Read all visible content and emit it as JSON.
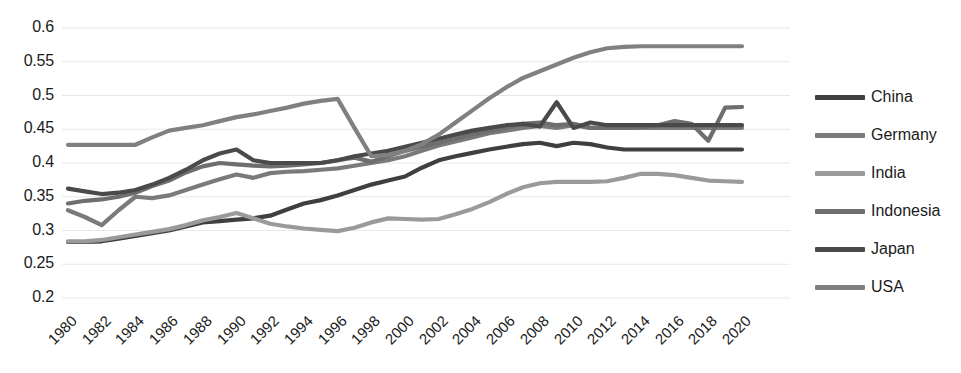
{
  "chart_data": {
    "type": "line",
    "title": "",
    "xlabel": "",
    "ylabel": "",
    "grid": true,
    "legend_position": "right",
    "ylim": [
      0.2,
      0.6
    ],
    "ytick_values": [
      0.6,
      0.55,
      0.5,
      0.45,
      0.4,
      0.35,
      0.3,
      0.25,
      0.2
    ],
    "ytick_labels": [
      "0.6",
      "0.55",
      "0.5",
      "0.45",
      "0.4",
      "0.35",
      "0.3",
      "0.25",
      "0.2"
    ],
    "x": [
      1980,
      1981,
      1982,
      1983,
      1984,
      1985,
      1986,
      1987,
      1988,
      1989,
      1990,
      1991,
      1992,
      1993,
      1994,
      1995,
      1996,
      1997,
      1998,
      1999,
      2000,
      2001,
      2002,
      2003,
      2004,
      2005,
      2006,
      2007,
      2008,
      2009,
      2010,
      2011,
      2012,
      2013,
      2014,
      2015,
      2016,
      2017,
      2018,
      2019,
      2020
    ],
    "xtick_labels": [
      "1980",
      "1982",
      "1984",
      "1986",
      "1988",
      "1990",
      "1992",
      "1994",
      "1996",
      "1998",
      "2000",
      "2002",
      "2004",
      "2006",
      "2008",
      "2010",
      "2012",
      "2014",
      "2016",
      "2018",
      "2020"
    ],
    "series": [
      {
        "name": "China",
        "color": "#3f3f3f",
        "values": [
          0.283,
          0.283,
          0.284,
          0.288,
          0.292,
          0.296,
          0.3,
          0.306,
          0.312,
          0.314,
          0.316,
          0.318,
          0.322,
          0.331,
          0.34,
          0.345,
          0.352,
          0.36,
          0.368,
          0.374,
          0.38,
          0.393,
          0.404,
          0.41,
          0.415,
          0.42,
          0.424,
          0.428,
          0.43,
          0.425,
          0.43,
          0.428,
          0.423,
          0.42,
          0.42,
          0.42,
          0.42,
          0.42,
          0.42,
          0.42,
          0.42
        ]
      },
      {
        "name": "Germany",
        "color": "#7a7a7a",
        "values": [
          0.33,
          0.32,
          0.308,
          0.33,
          0.35,
          0.348,
          0.352,
          0.36,
          0.368,
          0.376,
          0.383,
          0.378,
          0.385,
          0.387,
          0.388,
          0.39,
          0.392,
          0.396,
          0.4,
          0.404,
          0.41,
          0.418,
          0.426,
          0.432,
          0.438,
          0.444,
          0.448,
          0.452,
          0.455,
          0.452,
          0.456,
          0.452,
          0.452,
          0.452,
          0.452,
          0.452,
          0.452,
          0.452,
          0.452,
          0.452,
          0.452
        ]
      },
      {
        "name": "India",
        "color": "#9a9a9a",
        "values": [
          0.284,
          0.284,
          0.286,
          0.29,
          0.294,
          0.298,
          0.302,
          0.308,
          0.315,
          0.32,
          0.326,
          0.318,
          0.31,
          0.306,
          0.303,
          0.301,
          0.299,
          0.304,
          0.312,
          0.318,
          0.317,
          0.316,
          0.317,
          0.324,
          0.332,
          0.342,
          0.354,
          0.364,
          0.37,
          0.372,
          0.372,
          0.372,
          0.373,
          0.378,
          0.384,
          0.384,
          0.382,
          0.378,
          0.374,
          0.373,
          0.372
        ]
      },
      {
        "name": "Indonesia",
        "color": "#6e6e6e",
        "values": [
          0.34,
          0.344,
          0.346,
          0.35,
          0.356,
          0.366,
          0.374,
          0.386,
          0.395,
          0.4,
          0.398,
          0.396,
          0.395,
          0.396,
          0.398,
          0.4,
          0.404,
          0.408,
          0.402,
          0.41,
          0.418,
          0.424,
          0.43,
          0.436,
          0.442,
          0.448,
          0.452,
          0.458,
          0.46,
          0.456,
          0.458,
          0.452,
          0.452,
          0.452,
          0.453,
          0.456,
          0.462,
          0.458,
          0.433,
          0.482,
          0.483
        ]
      },
      {
        "name": "Japan",
        "color": "#4a4a4a",
        "values": [
          0.362,
          0.358,
          0.354,
          0.356,
          0.36,
          0.368,
          0.378,
          0.39,
          0.404,
          0.414,
          0.42,
          0.404,
          0.4,
          0.4,
          0.4,
          0.4,
          0.404,
          0.41,
          0.414,
          0.418,
          0.424,
          0.43,
          0.436,
          0.442,
          0.448,
          0.452,
          0.456,
          0.458,
          0.454,
          0.49,
          0.452,
          0.46,
          0.456,
          0.456,
          0.456,
          0.456,
          0.456,
          0.456,
          0.456,
          0.456,
          0.456
        ]
      },
      {
        "name": "USA",
        "color": "#808080",
        "values": [
          0.427,
          0.427,
          0.427,
          0.427,
          0.427,
          0.438,
          0.448,
          0.452,
          0.456,
          0.462,
          0.468,
          0.472,
          0.477,
          0.482,
          0.488,
          0.492,
          0.495,
          0.452,
          0.41,
          0.412,
          0.418,
          0.428,
          0.442,
          0.46,
          0.478,
          0.496,
          0.512,
          0.526,
          0.536,
          0.546,
          0.556,
          0.564,
          0.57,
          0.572,
          0.573,
          0.573,
          0.573,
          0.573,
          0.573,
          0.573,
          0.573
        ]
      }
    ]
  }
}
